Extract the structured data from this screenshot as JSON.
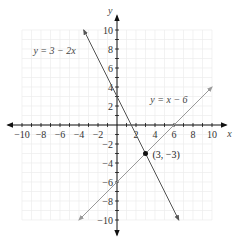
{
  "chart_data": {
    "type": "line",
    "title": "",
    "xlabel": "x",
    "ylabel": "y",
    "xlim": [
      -10,
      10
    ],
    "ylim": [
      -10,
      10
    ],
    "grid": true,
    "x_ticks": [
      -10,
      -8,
      -6,
      -4,
      -2,
      2,
      4,
      6,
      8,
      10
    ],
    "y_ticks": [
      -10,
      -8,
      -6,
      -4,
      -2,
      2,
      4,
      6,
      8,
      10
    ],
    "x_tick_labels": [
      "−10",
      "−8",
      "−6",
      "−4",
      "−2",
      "2",
      "4",
      "6",
      "8",
      "10"
    ],
    "y_tick_labels": [
      "−10",
      "−8",
      "−6",
      "−4",
      "−2",
      "2",
      "4",
      "6",
      "8",
      "10"
    ],
    "series": [
      {
        "name": "y = 3 − 2x",
        "x": [
          -3.5,
          6.5
        ],
        "y": [
          10,
          -10
        ],
        "color": "#555555"
      },
      {
        "name": "y = x − 6",
        "x": [
          -4,
          10
        ],
        "y": [
          -10,
          4
        ],
        "color": "#999999"
      }
    ],
    "annotations": [
      {
        "text": "(3, −3)",
        "x": 3,
        "y": -3,
        "type": "intersection-point"
      }
    ]
  },
  "labels": {
    "x_axis": "x",
    "y_axis": "y",
    "line1": "y = 3 − 2x",
    "line2": "y = x − 6",
    "point": "(3, −3)"
  }
}
